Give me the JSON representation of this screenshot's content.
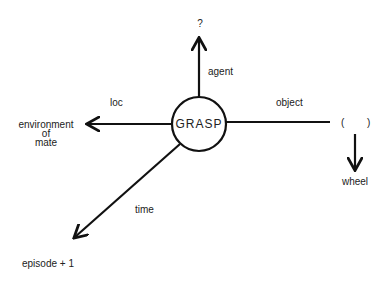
{
  "diagram": {
    "type": "conceptual dependency",
    "center": {
      "label": "GRASP"
    },
    "edges": [
      {
        "name": "agent",
        "label": "agent",
        "target": "?"
      },
      {
        "name": "loc",
        "label": "loc",
        "target": "environment of mate"
      },
      {
        "name": "object",
        "label": "object",
        "target": "( )"
      },
      {
        "name": "time",
        "label": "time",
        "target": "episode + 1"
      }
    ],
    "nodes": {
      "agent_target": "?",
      "loc_target_lines": [
        "environment",
        "of",
        "mate"
      ],
      "object_target_open": "(",
      "object_target_close": ")",
      "object_sub": "wheel",
      "time_target": "episode + 1"
    },
    "colors": {
      "stroke": "#111111",
      "background": "#ffffff"
    }
  }
}
